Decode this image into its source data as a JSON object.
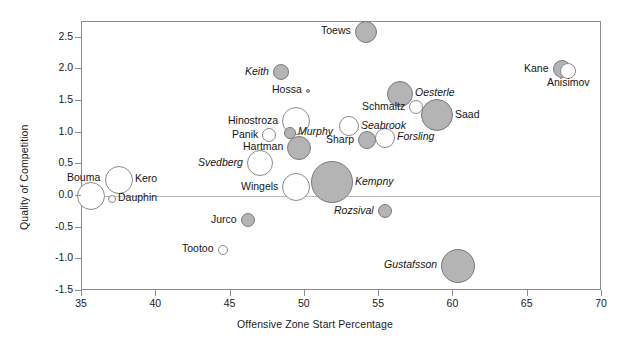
{
  "chart_data": {
    "type": "scatter",
    "title": "",
    "xlabel": "Offensive Zone Start Percentage",
    "ylabel": "Quality of Competition",
    "xlim": [
      35,
      70
    ],
    "ylim": [
      -1.5,
      2.75
    ],
    "xticks": [
      "35",
      "40",
      "45",
      "50",
      "55",
      "60",
      "65",
      "70"
    ],
    "xtick_values": [
      35,
      40,
      45,
      50,
      55,
      60,
      65,
      70
    ],
    "yticks": [
      "2.5",
      "2.0",
      "1.5",
      "1.0",
      "0.5",
      "0.0",
      "-0.5",
      "-1.0",
      "-1.5"
    ],
    "ytick_values": [
      2.5,
      2.0,
      1.5,
      1.0,
      0.5,
      0.0,
      -0.5,
      -1.0,
      -1.5
    ],
    "grid": false,
    "legend": "none",
    "zero_reference_line": 0.0,
    "size_encoding": "bubble area = time on ice",
    "fill_encoding": "gray fill vs. white open marker",
    "points": [
      {
        "name": "Toews",
        "x": 54.1,
        "y": 2.6,
        "r": 11,
        "fill": "gray",
        "label_pos": "left",
        "italic": false
      },
      {
        "name": "Keith",
        "x": 48.4,
        "y": 1.96,
        "r": 8,
        "fill": "gray",
        "label_pos": "left",
        "italic": true
      },
      {
        "name": "Hossa",
        "x": 50.2,
        "y": 1.66,
        "r": 2,
        "fill": "gray",
        "label_pos": "left",
        "italic": false
      },
      {
        "name": "Kane",
        "x": 67.3,
        "y": 2.0,
        "r": 9,
        "fill": "gray",
        "label_pos": "left",
        "italic": false
      },
      {
        "name": "Anisimov",
        "x": 67.7,
        "y": 1.98,
        "r": 8,
        "fill": "white",
        "label_pos": "below",
        "italic": false
      },
      {
        "name": "Oesterle",
        "x": 56.4,
        "y": 1.62,
        "r": 13,
        "fill": "gray",
        "label_pos": "right",
        "italic": true
      },
      {
        "name": "Schmaltz",
        "x": 57.5,
        "y": 1.4,
        "r": 7,
        "fill": "white",
        "label_pos": "left",
        "italic": false
      },
      {
        "name": "Saad",
        "x": 58.9,
        "y": 1.28,
        "r": 16,
        "fill": "gray",
        "label_pos": "right",
        "italic": false
      },
      {
        "name": "Hinostroza",
        "x": 49.4,
        "y": 1.18,
        "r": 14,
        "fill": "white",
        "label_pos": "left",
        "italic": false
      },
      {
        "name": "Panik",
        "x": 47.6,
        "y": 0.96,
        "r": 7,
        "fill": "white",
        "label_pos": "left",
        "italic": false
      },
      {
        "name": "Murphy",
        "x": 49.0,
        "y": 1.0,
        "r": 6,
        "fill": "gray",
        "label_pos": "right",
        "italic": true
      },
      {
        "name": "Seabrook",
        "x": 53.0,
        "y": 1.1,
        "r": 10,
        "fill": "white",
        "label_pos": "right",
        "italic": true
      },
      {
        "name": "Forsling",
        "x": 55.4,
        "y": 0.92,
        "r": 10,
        "fill": "white",
        "label_pos": "right",
        "italic": true
      },
      {
        "name": "Sharp",
        "x": 54.2,
        "y": 0.88,
        "r": 9,
        "fill": "gray",
        "label_pos": "left",
        "italic": false
      },
      {
        "name": "Hartman",
        "x": 49.6,
        "y": 0.76,
        "r": 12,
        "fill": "gray",
        "label_pos": "left",
        "italic": false
      },
      {
        "name": "Svedberg",
        "x": 47.0,
        "y": 0.52,
        "r": 13,
        "fill": "white",
        "label_pos": "left",
        "italic": true
      },
      {
        "name": "Bouma",
        "x": 35.6,
        "y": 0.0,
        "r": 14,
        "fill": "white",
        "label_pos": "above",
        "italic": false
      },
      {
        "name": "Kero",
        "x": 37.5,
        "y": 0.26,
        "r": 14,
        "fill": "white",
        "label_pos": "right",
        "italic": false
      },
      {
        "name": "Dauphin",
        "x": 37.0,
        "y": -0.04,
        "r": 4,
        "fill": "white",
        "label_pos": "right",
        "italic": false
      },
      {
        "name": "Wingels",
        "x": 49.4,
        "y": 0.14,
        "r": 14,
        "fill": "white",
        "label_pos": "left",
        "italic": false
      },
      {
        "name": "Kempny",
        "x": 51.8,
        "y": 0.22,
        "r": 21,
        "fill": "gray",
        "label_pos": "right",
        "italic": true
      },
      {
        "name": "Rozsival",
        "x": 55.4,
        "y": -0.24,
        "r": 7,
        "fill": "gray",
        "label_pos": "left",
        "italic": true
      },
      {
        "name": "Jurco",
        "x": 46.2,
        "y": -0.38,
        "r": 7,
        "fill": "gray",
        "label_pos": "left",
        "italic": false
      },
      {
        "name": "Tootoo",
        "x": 44.5,
        "y": -0.85,
        "r": 5,
        "fill": "white",
        "label_pos": "left",
        "italic": false
      },
      {
        "name": "Gustafsson",
        "x": 60.3,
        "y": -1.1,
        "r": 17,
        "fill": "gray",
        "label_pos": "left",
        "italic": true
      }
    ]
  },
  "axes": {
    "x_title": "Offensive Zone Start Percentage",
    "y_title": "Quality of Competition"
  },
  "colors": {
    "marker_fill_gray": "#b4b4b4",
    "marker_fill_white": "#ffffff",
    "marker_stroke": "#8a8a8a",
    "axis_line": "#8d8d8d",
    "zero_line": "#b9b9b9",
    "text": "#1a1a1a",
    "background": "#ffffff"
  },
  "ghost": {
    "top_strip": "",
    "bottom_strip": ""
  }
}
